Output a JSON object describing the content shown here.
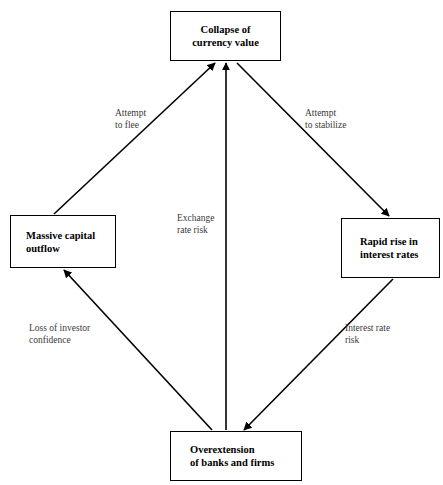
{
  "page": {
    "caption_fragment": "",
    "background_color": "#ffffff",
    "line_color": "#000000",
    "text_color": "#000000",
    "edge_label_color": "#3a3a3a"
  },
  "diagram": {
    "type": "flowchart",
    "shape": "diamond",
    "nodes": [
      {
        "id": "collapse-of-currency-value",
        "label": "Collapse of\ncurrency value",
        "position": "top",
        "x": 170,
        "y": 11,
        "width": 111,
        "height": 50
      },
      {
        "id": "massive-capital-outflow",
        "label": "Massive capital\noutflow",
        "position": "left",
        "x": 10,
        "y": 215,
        "width": 106,
        "height": 53
      },
      {
        "id": "rapid-rise-in-interest-rates",
        "label": "Rapid rise in\ninterest rates",
        "position": "right",
        "x": 341,
        "y": 218,
        "width": 99,
        "height": 60
      },
      {
        "id": "overextension-of-banks-and-firms",
        "label": "Overextension\nof banks and firms",
        "position": "bottom",
        "x": 170,
        "y": 431,
        "width": 132,
        "height": 50
      }
    ],
    "edges": [
      {
        "id": "edge-outflow-to-collapse",
        "from": "massive-capital-outflow",
        "to": "collapse-of-currency-value",
        "label": "Attempt\nto flee",
        "arrowhead": "end"
      },
      {
        "id": "edge-collapse-to-interest-rates",
        "from": "collapse-of-currency-value",
        "to": "rapid-rise-in-interest-rates",
        "label": "Attempt\nto stabilize",
        "arrowhead": "end"
      },
      {
        "id": "edge-overextension-to-collapse",
        "from": "overextension-of-banks-and-firms",
        "to": "collapse-of-currency-value",
        "label": "Exchange\nrate risk",
        "arrowhead": "end"
      },
      {
        "id": "edge-overextension-to-outflow",
        "from": "overextension-of-banks-and-firms",
        "to": "massive-capital-outflow",
        "label": "Loss of investor\nconfidence",
        "arrowhead": "end"
      },
      {
        "id": "edge-interest-rates-to-overextension",
        "from": "rapid-rise-in-interest-rates",
        "to": "overextension-of-banks-and-firms",
        "label": "Interest rate\nrisk",
        "arrowhead": "end"
      }
    ]
  }
}
